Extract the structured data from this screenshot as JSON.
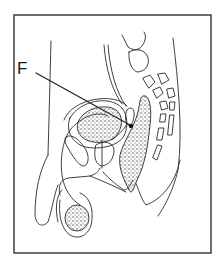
{
  "figure": {
    "labels": [
      {
        "id": "F",
        "text": "F",
        "points_to": "ejaculatory duct region near prostate"
      }
    ]
  },
  "colors": {
    "line": "#2a2a2a",
    "frame": "#222222",
    "background": "#ffffff",
    "stipple": "#555555"
  }
}
